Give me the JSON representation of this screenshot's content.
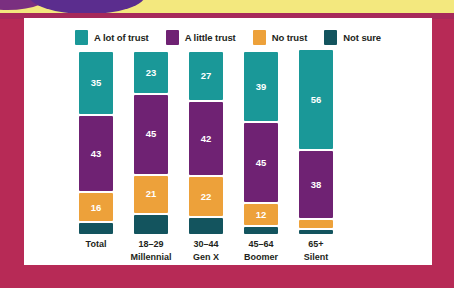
{
  "decor": {
    "banner_color": "#f3e87e",
    "background_color": "#b72a56",
    "ellipse_color": "#5b2d8e",
    "card_color": "#ffffff"
  },
  "colors": {
    "a_lot_of_trust": "#1a9898",
    "a_little_trust": "#6f2273",
    "no_trust": "#eda13a",
    "not_sure": "#13545e",
    "value_text": "#ffffff",
    "axis_text": "#231f20"
  },
  "legend": {
    "items": [
      {
        "label": "A lot of trust",
        "color": "#1a9898",
        "swatch_name": "legend-swatch-a-lot-of-trust"
      },
      {
        "label": "A little trust",
        "color": "#6f2273",
        "swatch_name": "legend-swatch-a-little-trust"
      },
      {
        "label": "No trust",
        "color": "#eda13a",
        "swatch_name": "legend-swatch-no-trust"
      },
      {
        "label": "Not sure",
        "color": "#13545e",
        "swatch_name": "legend-swatch-not-sure"
      }
    ]
  },
  "chart_data": {
    "type": "bar",
    "subtype": "stacked-column",
    "title": "",
    "xlabel": "",
    "ylabel": "",
    "ylim": [
      0,
      100
    ],
    "grid": false,
    "legend_position": "top-center",
    "stacked_total": 100,
    "categories": [
      "Total",
      "18–29",
      "30–44",
      "45–64",
      "65+"
    ],
    "category_sublabels": [
      "",
      "Millennial",
      "Gen X",
      "Boomer",
      "Silent"
    ],
    "series": [
      {
        "name": "A lot of trust",
        "color": "#1a9898",
        "values": [
          35,
          23,
          27,
          39,
          56
        ]
      },
      {
        "name": "A little trust",
        "color": "#6f2273",
        "values": [
          43,
          45,
          42,
          45,
          38
        ]
      },
      {
        "name": "No trust",
        "color": "#eda13a",
        "values": [
          16,
          21,
          22,
          12,
          5
        ]
      },
      {
        "name": "Not sure",
        "color": "#13545e",
        "values": [
          6,
          11,
          9,
          4,
          2
        ],
        "labels_shown": false
      }
    ]
  }
}
